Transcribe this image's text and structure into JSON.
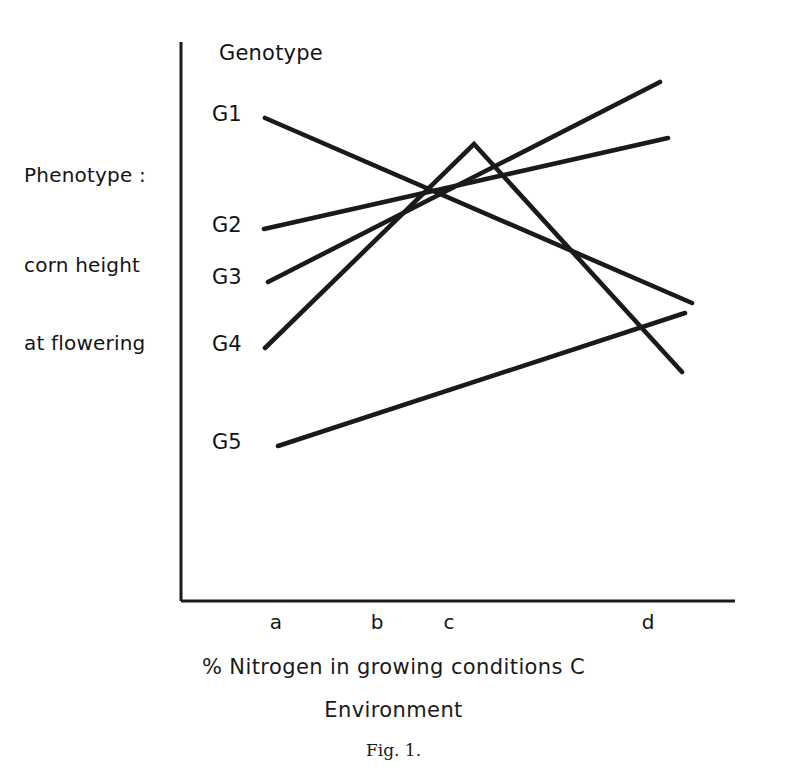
{
  "figure": {
    "number_label": "Fig. 1.",
    "legend_title": "Genotype",
    "y_axis_title_lines": [
      "Phenotype :",
      "corn height",
      "at flowering"
    ],
    "x_axis_caption_lines": [
      "% Nitrogen in growing conditions C",
      "Environment"
    ],
    "line_color": "#1a1a1a",
    "axis_color": "#1a1a1a",
    "background_color": "#ffffff"
  },
  "chart_data": {
    "type": "line",
    "title": "",
    "subtitle": "",
    "xlabel": "% Nitrogen in growing conditions C / Environment",
    "ylabel": "Phenotype : corn height at flowering",
    "categories": [
      "a",
      "b",
      "c",
      "d"
    ],
    "x_tick_labels": [
      "a",
      "b",
      "c",
      "d"
    ],
    "y_tick_labels": [
      "G1",
      "G2",
      "G3",
      "G4",
      "G5"
    ],
    "axis_ranges": {
      "x": [
        0,
        1
      ],
      "y": [
        0,
        1
      ]
    },
    "grid": false,
    "legend_position": "inside-top-left",
    "series": [
      {
        "name": "G1",
        "start_label": "G1",
        "trend": "decreasing",
        "points": [
          {
            "x": 265,
            "y": 118
          },
          {
            "x": 692,
            "y": 303
          }
        ]
      },
      {
        "name": "G2",
        "start_label": "G2",
        "trend": "increasing-shallow",
        "points": [
          {
            "x": 264,
            "y": 229
          },
          {
            "x": 668,
            "y": 138
          }
        ]
      },
      {
        "name": "G3",
        "start_label": "G3",
        "trend": "increasing-steep",
        "points": [
          {
            "x": 268,
            "y": 282
          },
          {
            "x": 660,
            "y": 82
          }
        ]
      },
      {
        "name": "G4",
        "start_label": "G4",
        "trend": "rise-then-fall",
        "points": [
          {
            "x": 265,
            "y": 348
          },
          {
            "x": 474,
            "y": 144
          },
          {
            "x": 682,
            "y": 372
          }
        ]
      },
      {
        "name": "G5",
        "start_label": "G5",
        "trend": "increasing-shallow",
        "points": [
          {
            "x": 278,
            "y": 446
          },
          {
            "x": 685,
            "y": 313
          }
        ]
      }
    ],
    "genotype_label_positions": [
      {
        "label": "G1",
        "x": 212,
        "y": 102
      },
      {
        "label": "G2",
        "x": 212,
        "y": 213
      },
      {
        "label": "G3",
        "x": 212,
        "y": 265
      },
      {
        "label": "G4",
        "x": 212,
        "y": 332
      },
      {
        "label": "G5",
        "x": 212,
        "y": 430
      }
    ],
    "x_tick_positions": [
      {
        "label": "a",
        "x": 276,
        "y": 610
      },
      {
        "label": "b",
        "x": 377,
        "y": 610
      },
      {
        "label": "c",
        "x": 449,
        "y": 610
      },
      {
        "label": "d",
        "x": 648,
        "y": 610
      }
    ],
    "axes": {
      "y_axis": {
        "x": 181,
        "y_top": 42,
        "y_bottom": 601
      },
      "x_axis": {
        "y": 601,
        "x_left": 181,
        "x_right": 735
      }
    }
  }
}
